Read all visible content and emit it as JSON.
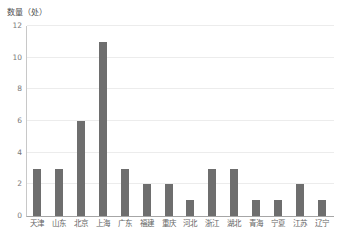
{
  "chart_data": {
    "type": "bar",
    "title": "",
    "subtitle": "",
    "xlabel": "",
    "ylabel": "数量（处）",
    "categories": [
      "天津",
      "山东",
      "北京",
      "上海",
      "广东",
      "福建",
      "重庆",
      "河北",
      "浙江",
      "湖北",
      "青海",
      "宁夏",
      "江苏",
      "辽宁"
    ],
    "values": [
      3,
      3,
      6,
      11,
      3,
      2,
      2,
      1,
      3,
      3,
      1,
      1,
      2,
      1
    ],
    "ylim": [
      0,
      12
    ],
    "y_ticks": [
      0,
      2,
      4,
      6,
      8,
      10,
      12
    ],
    "y_tick_labels": [
      "0",
      "2",
      "4",
      "6",
      "8",
      "10",
      "12"
    ],
    "grid": true,
    "grid_axis": "y",
    "legend": false,
    "legend_position": "none",
    "bar_color": "#6e6e6e",
    "gridline_color": "#ececec",
    "axis_color": "#a6a6a6",
    "background_color": "#ffffff",
    "tick_label_color": "#7a7a7a",
    "series": [
      {
        "name": "数量（处）",
        "values": [
          3,
          3,
          6,
          11,
          3,
          2,
          2,
          1,
          3,
          3,
          1,
          1,
          2,
          1
        ]
      }
    ]
  }
}
